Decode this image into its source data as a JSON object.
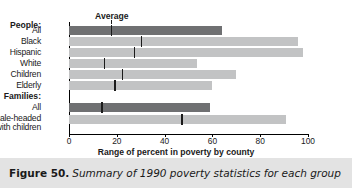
{
  "figure": {
    "number_label": "Figure 50.",
    "caption": "Summary of 1990 poverty statistics for each group"
  },
  "chart_data": {
    "type": "bar",
    "title": "",
    "xlabel": "Range of percent in poverty by county",
    "ylabel": "",
    "xlim": [
      0,
      100
    ],
    "xticks": [
      "0",
      "20",
      "40",
      "60",
      "80",
      "100"
    ],
    "grid": false,
    "legend": false,
    "annotations": [
      {
        "text": "Average",
        "x": 17.5,
        "group": "People: All"
      }
    ],
    "group_headers": [
      "People:",
      "Families:"
    ],
    "groups": [
      {
        "name": "People:",
        "categories": [
          "All",
          "Black",
          "Hispanic",
          "White",
          "Children",
          "Elderly"
        ],
        "values": [
          64,
          96,
          98,
          53.5,
          70,
          60
        ],
        "averages": [
          17.5,
          30,
          27,
          14.5,
          22,
          19
        ],
        "shades": [
          "dark",
          "light",
          "light",
          "light",
          "light",
          "light"
        ]
      },
      {
        "name": "Families:",
        "categories": [
          "All",
          "Female-headed\nwith children"
        ],
        "values": [
          59,
          91
        ],
        "averages": [
          13.5,
          47
        ],
        "shades": [
          "dark",
          "light"
        ]
      }
    ]
  },
  "axis": {
    "ticks": [
      {
        "label": "0",
        "value": 0
      },
      {
        "label": "20",
        "value": 20
      },
      {
        "label": "40",
        "value": 40
      },
      {
        "label": "60",
        "value": 60
      },
      {
        "label": "80",
        "value": 80
      },
      {
        "label": "100",
        "value": 100
      }
    ]
  },
  "rows": [
    {
      "label": "People:",
      "type": "header"
    },
    {
      "label": "All",
      "type": "bar",
      "value": 64,
      "average": 17.5,
      "shade": "dark"
    },
    {
      "label": "Black",
      "type": "bar",
      "value": 96,
      "average": 30,
      "shade": "light"
    },
    {
      "label": "Hispanic",
      "type": "bar",
      "value": 98,
      "average": 27,
      "shade": "light"
    },
    {
      "label": "White",
      "type": "bar",
      "value": 53.5,
      "average": 14.5,
      "shade": "light"
    },
    {
      "label": "Children",
      "type": "bar",
      "value": 70,
      "average": 22,
      "shade": "light"
    },
    {
      "label": "Elderly",
      "type": "bar",
      "value": 60,
      "average": 19,
      "shade": "light"
    },
    {
      "label": "Families:",
      "type": "header"
    },
    {
      "label": "All",
      "type": "bar",
      "value": 59,
      "average": 13.5,
      "shade": "dark"
    },
    {
      "label": "Female-headed",
      "label2": "with children",
      "type": "bar",
      "value": 91,
      "average": 47,
      "shade": "light"
    }
  ],
  "annotation": {
    "average_label": "Average"
  },
  "colors": {
    "bar_dark": "#6f7072",
    "bar_light": "#c2c3c4",
    "axis": "#000000",
    "caption_bg": "#e3e3e3",
    "average_marker": "#1b1b1b"
  }
}
